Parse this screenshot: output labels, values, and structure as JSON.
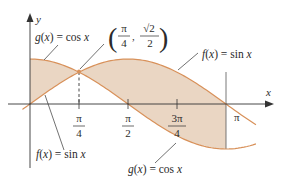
{
  "chart_data": {
    "type": "area",
    "title": "",
    "xlabel": "x",
    "ylabel": "y",
    "xlim": [
      0,
      3.14159
    ],
    "ylim": [
      -1,
      1
    ],
    "grid": false,
    "x_ticks": [
      {
        "value": 0.7854,
        "label_num": "π",
        "label_den": "4"
      },
      {
        "value": 1.5708,
        "label_num": "π",
        "label_den": "2"
      },
      {
        "value": 2.3562,
        "label_num": "3π",
        "label_den": "4"
      },
      {
        "value": 3.14159,
        "label": "π"
      }
    ],
    "series": [
      {
        "name": "f(x) = sin x",
        "function": "sin",
        "x": [
          0,
          0.7854,
          1.5708,
          2.3562,
          3.14159
        ],
        "values": [
          0,
          0.7071,
          1,
          0.7071,
          0
        ]
      },
      {
        "name": "g(x) = cos x",
        "function": "cos",
        "x": [
          0,
          0.7854,
          1.5708,
          2.3562,
          3.14159
        ],
        "values": [
          1,
          0.7071,
          0,
          -0.7071,
          -1
        ]
      }
    ],
    "shaded_region": "between f and g from x = 0 to x = π",
    "intersection": {
      "x": 0.7854,
      "y": 0.7071,
      "label_x_num": "π",
      "label_x_den": "4",
      "label_y_num": "√2",
      "label_y_den": "2"
    },
    "annotations": [
      {
        "text": "g(x) = cos x",
        "position": "top-left"
      },
      {
        "text": "f(x) = sin x",
        "position": "top-right"
      },
      {
        "text": "f(x) = sin x",
        "position": "bottom-left"
      },
      {
        "text": "g(x) = cos x",
        "position": "bottom-right"
      }
    ],
    "colors": {
      "fill": "#ead6c3",
      "curve": "#d8915a",
      "axis": "#333333",
      "text": "#2b2b2b"
    }
  },
  "labels": {
    "y_axis": "y",
    "x_axis": "x",
    "g_top": "g(x) = cos x",
    "f_top": "f(x) = sin x",
    "f_bottom": "f(x) = sin x",
    "g_bottom": "g(x) = cos x",
    "tick_pi4_num": "π",
    "tick_pi4_den": "4",
    "tick_pi2_num": "π",
    "tick_pi2_den": "2",
    "tick_3pi4_num": "3π",
    "tick_3pi4_den": "4",
    "tick_pi": "π",
    "pt_x_num": "π",
    "pt_x_den": "4",
    "pt_y_num": "√2",
    "pt_y_den": "2",
    "pt_comma": ","
  }
}
